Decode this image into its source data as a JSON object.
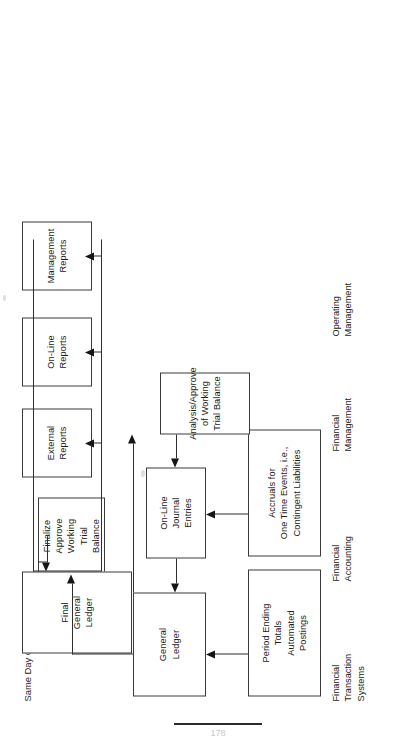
{
  "diagram": {
    "title": "Same Day Close",
    "orientation": "rotated-90-ccw",
    "nodes": [
      {
        "id": "period-ending-totals",
        "label": "Period Ending\nTotals\nAutomated\nPostings"
      },
      {
        "id": "accruals",
        "label": "Accruals for\nOne Time Events, i.e.,\nContingent Liabilities"
      },
      {
        "id": "general-ledger",
        "label": "General\nLedger"
      },
      {
        "id": "online-journal-entries",
        "label": "On-Line\nJournal\nEntries"
      },
      {
        "id": "analysis-approve",
        "label": "Analysis/Approve\nof Working\nTrial Balance"
      },
      {
        "id": "finalize-approve",
        "label": "Finalize\nApprove\nWorking\nTrial\nBalance"
      },
      {
        "id": "final-general-ledger",
        "label": "Final\nGeneral\nLedger"
      },
      {
        "id": "external-reports",
        "label": "External\nReports"
      },
      {
        "id": "online-reports",
        "label": "On-Line\nReports"
      },
      {
        "id": "management-reports",
        "label": "Management\nReports"
      }
    ],
    "lanes": [
      {
        "id": "financial-transaction-systems",
        "label": "Financial\nTransaction\nSystems"
      },
      {
        "id": "financial-accounting",
        "label": "Financial\nAccounting"
      },
      {
        "id": "financial-management",
        "label": "Financial\nManagement"
      },
      {
        "id": "operating-management",
        "label": "Operating\nManagement"
      }
    ],
    "colors": {
      "box_border": "#3a3a3a",
      "connector": "#2f2f2f",
      "text": "#1b1b1b",
      "page": "#ffffff"
    }
  },
  "footer": {
    "page_number": "178"
  }
}
